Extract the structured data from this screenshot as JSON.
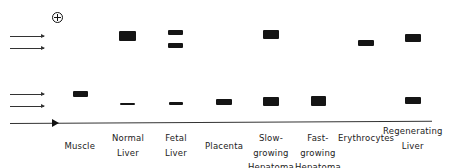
{
  "diagram": {
    "anode_symbol": "⊕",
    "migration_arrows": [
      {
        "y": 36
      },
      {
        "y": 48
      },
      {
        "y": 94
      },
      {
        "y": 106
      }
    ],
    "lanes": [
      {
        "label_lines": [
          "Muscle"
        ],
        "center_x": 80,
        "bands": [
          {
            "x": 73,
            "y": 91,
            "w": 15,
            "h": 6
          }
        ]
      },
      {
        "label_lines": [
          "Normal",
          "Liver"
        ],
        "center_x": 128,
        "bands": [
          {
            "x": 119,
            "y": 31,
            "w": 17,
            "h": 10
          },
          {
            "x": 120,
            "y": 103,
            "w": 15,
            "h": 1.5
          }
        ]
      },
      {
        "label_lines": [
          "Fetal",
          "Liver"
        ],
        "center_x": 176,
        "bands": [
          {
            "x": 168,
            "y": 30,
            "w": 15,
            "h": 5
          },
          {
            "x": 168,
            "y": 43,
            "w": 15,
            "h": 5
          },
          {
            "x": 169,
            "y": 102,
            "w": 14,
            "h": 2.5
          }
        ]
      },
      {
        "label_lines": [
          "Placenta"
        ],
        "center_x": 224,
        "bands": [
          {
            "x": 216,
            "y": 99,
            "w": 16,
            "h": 6
          }
        ]
      },
      {
        "label_lines": [
          "Slow-",
          "growing",
          "Hepatoma"
        ],
        "center_x": 271,
        "bands": [
          {
            "x": 263,
            "y": 30,
            "w": 16,
            "h": 9
          },
          {
            "x": 263,
            "y": 97,
            "w": 16,
            "h": 9
          }
        ]
      },
      {
        "label_lines": [
          "Fast-",
          "growing",
          "Hepatoma"
        ],
        "center_x": 318,
        "bands": [
          {
            "x": 311,
            "y": 96,
            "w": 15,
            "h": 10
          }
        ]
      },
      {
        "label_lines": [
          "Erythrocytes"
        ],
        "center_x": 366,
        "bands": [
          {
            "x": 358,
            "y": 40,
            "w": 16,
            "h": 6
          }
        ]
      },
      {
        "label_lines": [
          "Regenerating",
          "Liver"
        ],
        "center_x": 413,
        "bands": [
          {
            "x": 405,
            "y": 34,
            "w": 16,
            "h": 8
          },
          {
            "x": 405,
            "y": 97,
            "w": 16,
            "h": 7
          }
        ]
      }
    ]
  }
}
